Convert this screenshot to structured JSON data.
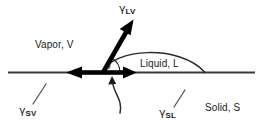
{
  "diagram": {
    "canvas": {
      "width": 263,
      "height": 128,
      "background": "#ffffff"
    },
    "colors": {
      "line": "#3a3a3a",
      "vector": "#000000",
      "droplet": "#2b2b2b",
      "text": "#1a1a1a",
      "leader": "#555555"
    },
    "labels": {
      "gamma_lv": {
        "symbol": "γ",
        "subscript": "LV"
      },
      "gamma_sv": {
        "symbol": "γ",
        "subscript": "SV"
      },
      "gamma_sl": {
        "symbol": "γ",
        "subscript": "SL"
      },
      "theta": "θ",
      "vapor": "Vapor, V",
      "liquid": "Liquid, L",
      "solid": "Solid, S"
    }
  }
}
